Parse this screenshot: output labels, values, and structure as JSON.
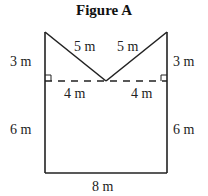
{
  "figure": {
    "title": "Figure A",
    "labels": {
      "left_top": "3 m",
      "right_top": "3 m",
      "left_slant": "5 m",
      "right_slant": "5 m",
      "left_half_base": "4 m",
      "right_half_base": "4 m",
      "left_side": "6 m",
      "right_side": "6 m",
      "bottom": "8 m"
    },
    "colors": {
      "line": "#222222",
      "background": "#ffffff"
    }
  }
}
